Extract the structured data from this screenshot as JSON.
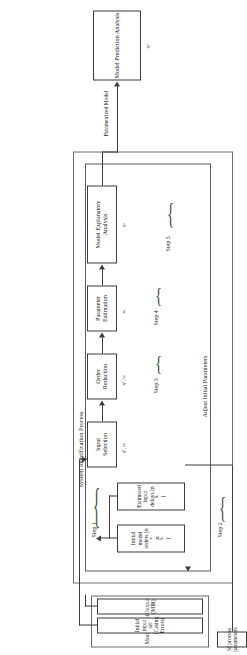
{
  "figure": {
    "orientation": "rotated-90-ccw"
  },
  "outputs": {
    "prediction": {
      "label": "Model Prediction Analysis",
      "tag": "sp"
    }
  },
  "edges": {
    "parameterized_model": "Parametrized Model",
    "adjust_initial_parameters": "Adjust Initial Parameters"
  },
  "si_process": {
    "title": "System Identification Process",
    "steps": [
      {
        "name": "Step 1",
        "boxes": [
          {
            "label_line1": "Initial model",
            "label_line2": "orders (n",
            "sub_a": "a",
            "mid": ",n",
            "sub_b": "b",
            "close": ")"
          },
          {
            "label_line1": "Estimated input",
            "label_line2": "delays (n",
            "sub_k": "k",
            "close": ")"
          }
        ],
        "tag": ""
      },
      {
        "name": "Step 2",
        "box": {
          "line1": "Input",
          "line2": "Selection"
        },
        "tag": "sf , sa"
      },
      {
        "name": "Step 3",
        "box": {
          "line1": "Order",
          "line2": "Reduction"
        },
        "tag": "sf , sa"
      },
      {
        "name": "Step 4",
        "box": {
          "line1": "Parameter",
          "line2": "Estimation"
        },
        "tag": "sa"
      },
      {
        "name": "Step 5",
        "box": {
          "line1": "Model Explanatory",
          "line2": "Analysis"
        },
        "tag": "sp"
      }
    ]
  },
  "model_choices": {
    "title": "Model Choices",
    "boxes": [
      {
        "line1": "Initial input set",
        "line2": "(Casing Errors)"
      },
      {
        "line1": "Output",
        "line2": "(MIR)"
      }
    ]
  },
  "si_parameters": {
    "line1": "SI process",
    "line2": "parameters"
  }
}
